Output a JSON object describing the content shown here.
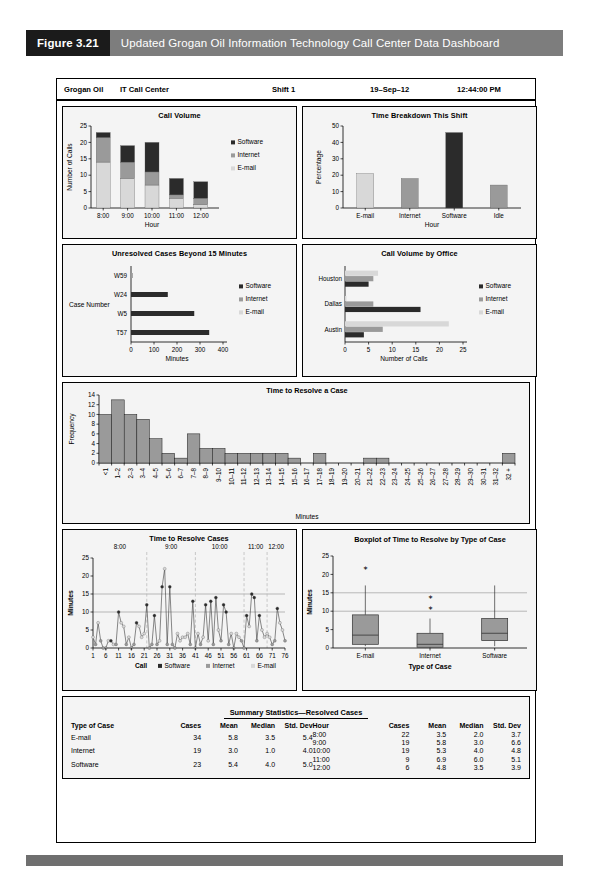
{
  "figure": {
    "number": "Figure 3.21",
    "title": "Updated Grogan Oil Information Technology Call Center Data Dashboard"
  },
  "dashboard_header": {
    "company": "Grogan Oil",
    "department": "IT Call Center",
    "shift": "Shift 1",
    "date": "19–Sep–12",
    "time": "12:44:00 PM"
  },
  "colors": {
    "software": "#2b2b2b",
    "internet": "#9a9a9a",
    "email": "#d8d8d8",
    "bar_fill": "#9a9a9a",
    "panel_bg": "#f4f4f4",
    "caption_num_bg": "#1b1b1b",
    "caption_title_bg": "#7d7d7d"
  },
  "legend_labels": {
    "software": "Software",
    "internet": "Internet",
    "email": "E-mail"
  },
  "chart_data": [
    {
      "id": "call_volume",
      "type": "bar",
      "title": "Call Volume",
      "xlabel": "Hour",
      "ylabel": "Number of Calls",
      "categories": [
        "8:00",
        "9:00",
        "10:00",
        "11:00",
        "12:00"
      ],
      "ylim": [
        0,
        25
      ],
      "yticks": [
        0,
        5,
        10,
        15,
        20,
        25
      ],
      "stacked": true,
      "series": [
        {
          "name": "E-mail",
          "values": [
            14,
            9,
            7,
            3,
            1
          ]
        },
        {
          "name": "Internet",
          "values": [
            7.5,
            5,
            4,
            1,
            2
          ]
        },
        {
          "name": "Software",
          "values": [
            1.5,
            5,
            9,
            5,
            5
          ]
        }
      ],
      "totals": [
        23,
        19,
        20,
        9,
        8
      ]
    },
    {
      "id": "time_breakdown",
      "type": "bar",
      "title": "Time Breakdown This Shift",
      "xlabel": "Hour",
      "ylabel": "Percentage",
      "categories": [
        "E-mail",
        "Internet",
        "Software",
        "Idle"
      ],
      "values": [
        21,
        18,
        46,
        14
      ],
      "ylim": [
        0,
        50
      ],
      "yticks": [
        0,
        10,
        20,
        30,
        40,
        50
      ],
      "bar_colors": [
        "#d8d8d8",
        "#9a9a9a",
        "#2b2b2b",
        "#9a9a9a"
      ]
    },
    {
      "id": "unresolved_cases",
      "type": "bar",
      "orientation": "horizontal",
      "title": "Unresolved Cases Beyond 15 Minutes",
      "xlabel": "Minutes",
      "ylabel": "Case Number",
      "categories": [
        "T57",
        "W5",
        "W24",
        "W59"
      ],
      "values": [
        340,
        275,
        160,
        8
      ],
      "bar_types": [
        "Software",
        "Software",
        "Software",
        "Internet"
      ],
      "xlim": [
        0,
        400
      ],
      "xticks": [
        0,
        100,
        200,
        300,
        400
      ]
    },
    {
      "id": "call_volume_by_office",
      "type": "bar",
      "orientation": "horizontal",
      "title": "Call Volume by Office",
      "xlabel": "Number of Calls",
      "ylabel": "",
      "categories": [
        "Austin",
        "Dallas",
        "Houston"
      ],
      "xlim": [
        0,
        25
      ],
      "xticks": [
        0,
        5,
        10,
        15,
        20,
        25
      ],
      "series": [
        {
          "name": "Software",
          "values": [
            4,
            16,
            5
          ]
        },
        {
          "name": "Internet",
          "values": [
            8,
            6,
            6
          ]
        },
        {
          "name": "E-mail",
          "values": [
            22,
            0.3,
            7
          ]
        }
      ]
    },
    {
      "id": "time_to_resolve_hist",
      "type": "bar",
      "title": "Time to Resolve a Case",
      "xlabel": "Minutes",
      "ylabel": "Frequency",
      "ylim": [
        0,
        14
      ],
      "yticks": [
        0,
        2,
        4,
        6,
        8,
        10,
        12,
        14
      ],
      "categories": [
        "<1",
        "1–2",
        "2–3",
        "3–4",
        "4–5",
        "5–6",
        "6–7",
        "7–8",
        "8–9",
        "9–10",
        "10–11",
        "11–12",
        "12–13",
        "13–14",
        "14–15",
        "15–16",
        "16–17",
        "17–18",
        "18–19",
        "19–20",
        "20–21",
        "21–22",
        "22–23",
        "23–24",
        "24–25",
        "25–26",
        "26–27",
        "27–28",
        "28–29",
        "29–30",
        "30–31",
        "31–32",
        "32 +"
      ],
      "values": [
        10,
        13,
        10,
        9,
        5,
        2,
        1,
        6,
        3,
        3,
        2,
        2,
        2,
        2,
        2,
        1,
        0,
        2,
        0,
        0,
        0,
        1,
        1,
        0,
        0,
        0,
        0,
        0,
        0,
        0,
        0,
        0,
        2
      ]
    },
    {
      "id": "time_to_resolve_cases",
      "type": "line",
      "title": "Time to Resolve Cases",
      "xlabel": "Call",
      "ylabel": "Minutes",
      "ylim": [
        0,
        25
      ],
      "yticks": [
        0,
        5,
        10,
        15,
        20,
        25
      ],
      "xticks": [
        1,
        6,
        11,
        16,
        21,
        26,
        31,
        36,
        41,
        46,
        51,
        56,
        61,
        66,
        71,
        76
      ],
      "hour_bands": [
        {
          "label": "8:00",
          "start": 1,
          "end": 22
        },
        {
          "label": "9:00",
          "start": 22,
          "end": 41
        },
        {
          "label": "10:00",
          "start": 41,
          "end": 60
        },
        {
          "label": "11:00",
          "start": 60,
          "end": 69
        },
        {
          "label": "12:00",
          "start": 69,
          "end": 77
        }
      ],
      "reference_lines": [
        10,
        15
      ],
      "values": [
        3,
        1,
        7,
        2,
        0,
        0,
        2,
        2,
        1,
        1,
        10,
        7,
        6,
        1,
        3,
        0,
        1,
        7,
        6,
        3,
        4,
        12,
        0,
        1,
        9,
        1,
        2,
        17,
        22,
        1,
        17,
        1,
        0,
        4,
        2,
        3,
        3,
        4,
        1,
        13,
        0,
        4,
        1,
        3,
        12,
        2,
        13,
        1,
        14,
        5,
        2,
        12,
        10,
        1,
        4,
        0,
        4,
        3,
        2,
        0,
        9,
        6,
        15,
        14,
        2,
        9,
        5,
        3,
        4,
        3,
        1,
        2,
        11,
        7,
        5,
        2
      ],
      "point_types": [
        "E-mail",
        "Internet",
        "E-mail",
        "Internet",
        "Internet",
        "Internet",
        "E-mail",
        "Software",
        "E-mail",
        "Internet",
        "Software",
        "E-mail",
        "E-mail",
        "Internet",
        "E-mail",
        "Internet",
        "Internet",
        "Software",
        "E-mail",
        "E-mail",
        "E-mail",
        "Software",
        "Internet",
        "Internet",
        "Software",
        "Internet",
        "E-mail",
        "Software",
        "E-mail",
        "Internet",
        "Software",
        "Internet",
        "Internet",
        "E-mail",
        "E-mail",
        "E-mail",
        "E-mail",
        "E-mail",
        "Internet",
        "Software",
        "Internet",
        "E-mail",
        "Internet",
        "E-mail",
        "Software",
        "E-mail",
        "Software",
        "Internet",
        "Software",
        "E-mail",
        "Internet",
        "Software",
        "Software",
        "Internet",
        "E-mail",
        "Internet",
        "E-mail",
        "E-mail",
        "Internet",
        "Internet",
        "Software",
        "E-mail",
        "Software",
        "Software",
        "Internet",
        "Software",
        "E-mail",
        "E-mail",
        "E-mail",
        "E-mail",
        "Internet",
        "Internet",
        "Software",
        "E-mail",
        "E-mail",
        "Internet"
      ]
    },
    {
      "id": "boxplot",
      "type": "boxplot",
      "title": "Boxplot of Time to Resolve by Type of Case",
      "xlabel": "Type of Case",
      "ylabel": "Minutes",
      "ylim": [
        0,
        25
      ],
      "yticks": [
        0,
        5,
        10,
        15,
        20,
        25
      ],
      "reference_lines": [
        10,
        15
      ],
      "categories": [
        "E-mail",
        "Internet",
        "Software"
      ],
      "boxes": [
        {
          "name": "E-mail",
          "min": 0.5,
          "q1": 1.0,
          "median": 3.5,
          "q3": 9.0,
          "max": 17.0,
          "outliers": [
            22
          ]
        },
        {
          "name": "Internet",
          "min": 0.0,
          "q1": 0.2,
          "median": 1.0,
          "q3": 4.0,
          "max": 8.0,
          "outliers": [
            11,
            14
          ]
        },
        {
          "name": "Software",
          "min": 0.5,
          "q1": 2.0,
          "median": 4.0,
          "q3": 8.0,
          "max": 17.0,
          "outliers": []
        }
      ]
    }
  ],
  "summary": {
    "title": "Summary Statistics—Resolved Cases",
    "left": {
      "headers": [
        "Type of Case",
        "Cases",
        "Mean",
        "Median",
        "Std. Dev"
      ],
      "rows": [
        [
          "E-mail",
          "34",
          "5.8",
          "3.5",
          "5.4"
        ],
        [
          "Internet",
          "19",
          "3.0",
          "1.0",
          "4.0"
        ],
        [
          "Software",
          "23",
          "5.4",
          "4.0",
          "5.0"
        ]
      ]
    },
    "right": {
      "headers": [
        "Hour",
        "Cases",
        "Mean",
        "Median",
        "Std. Dev"
      ],
      "rows": [
        [
          "8:00",
          "22",
          "3.5",
          "2.0",
          "3.7"
        ],
        [
          "9:00",
          "19",
          "5.8",
          "3.0",
          "6.6"
        ],
        [
          "10:00",
          "19",
          "5.3",
          "4.0",
          "4.8"
        ],
        [
          "11:00",
          "9",
          "6.9",
          "6.0",
          "5.1"
        ],
        [
          "12:00",
          "6",
          "4.8",
          "3.5",
          "3.9"
        ]
      ]
    }
  }
}
